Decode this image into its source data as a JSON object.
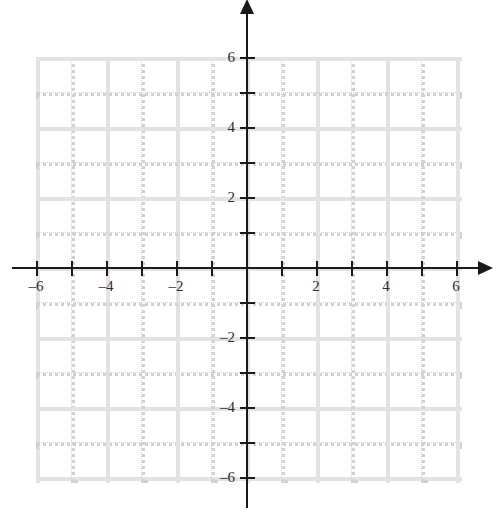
{
  "chart_data": {
    "type": "scatter",
    "title": "",
    "subtitle": "",
    "xlabel": "",
    "ylabel": "",
    "xlim": [
      -6,
      6
    ],
    "ylim": [
      -6,
      6
    ],
    "grid": true,
    "legend": null,
    "series": [],
    "annotations": [],
    "x_ticks": [
      -6,
      -5,
      -4,
      -3,
      -2,
      -1,
      1,
      2,
      3,
      4,
      5,
      6
    ],
    "y_ticks": [
      -6,
      -5,
      -4,
      -3,
      -2,
      -1,
      1,
      2,
      3,
      4,
      5,
      6
    ],
    "x_tick_labels": [
      {
        "value": -6,
        "text": "‒6"
      },
      {
        "value": -4,
        "text": "‒4"
      },
      {
        "value": -2,
        "text": "‒2"
      },
      {
        "value": 2,
        "text": "2"
      },
      {
        "value": 4,
        "text": "4"
      },
      {
        "value": 6,
        "text": "6"
      }
    ],
    "y_tick_labels": [
      {
        "value": 6,
        "text": "6"
      },
      {
        "value": 4,
        "text": "4"
      },
      {
        "value": 2,
        "text": "2"
      },
      {
        "value": -2,
        "text": "‒2"
      },
      {
        "value": -4,
        "text": "‒4"
      },
      {
        "value": -6,
        "text": "‒6"
      }
    ],
    "grid_step_major": 2,
    "grid_step_minor": 1,
    "axis_arrows": [
      "right",
      "up"
    ]
  },
  "style": {
    "background": "#ffffff",
    "axis_color": "#1a1a1a",
    "gridline_major_color": "#e3e3e3",
    "gridline_minor_color": "#d2d2d2",
    "label_color": "#2b2b2b"
  },
  "geometry": {
    "origin_x": 246,
    "origin_y": 267,
    "unit": 35,
    "grid_min": -6,
    "grid_max": 6,
    "axis_x_left": 12,
    "axis_x_right": 478,
    "axis_y_top": 14,
    "axis_y_bottom": 508
  }
}
